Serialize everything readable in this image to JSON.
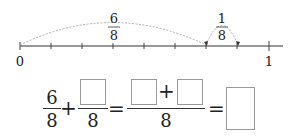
{
  "number_line": {
    "start_label": "0",
    "end_label": "1",
    "divisions": 8,
    "arc1": {
      "numerator": "6",
      "denominator": "8",
      "from_tick": 0,
      "to_tick": 6
    },
    "arc2": {
      "numerator": "1",
      "denominator": "8",
      "from_tick": 6,
      "to_tick": 7
    }
  },
  "equation": {
    "term1": {
      "numerator": "6",
      "denominator": "8"
    },
    "plus": "+",
    "term2": {
      "numerator": "",
      "denominator": "8"
    },
    "equals": "=",
    "combined": {
      "numerator_left": "",
      "plus": "+",
      "numerator_right": "",
      "denominator": "8"
    },
    "equals2": "=",
    "result": ""
  }
}
